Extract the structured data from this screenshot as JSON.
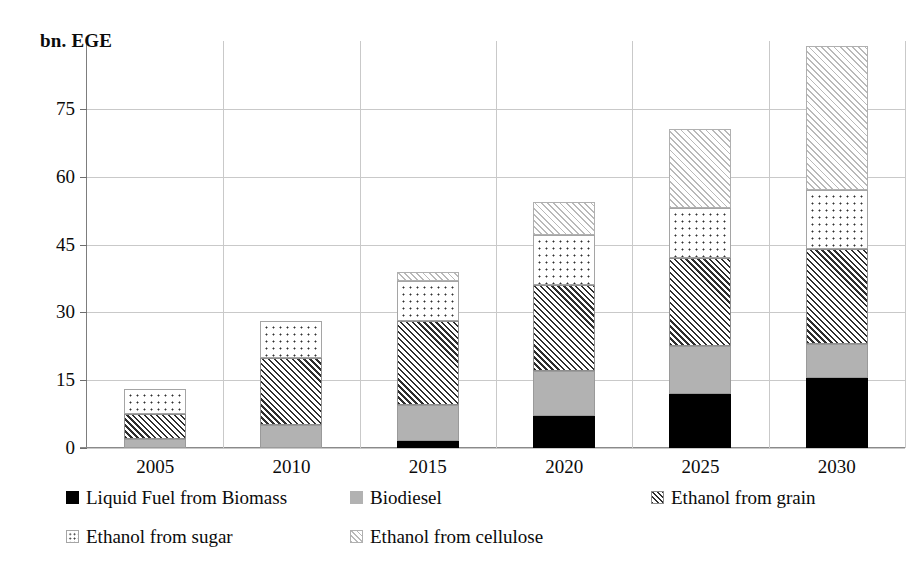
{
  "chart_data": {
    "type": "bar",
    "stacked": true,
    "title": "",
    "subtitle": "",
    "xlabel": "",
    "ylabel": "bn. EGE",
    "categories": [
      "2005",
      "2010",
      "2015",
      "2020",
      "2025",
      "2030"
    ],
    "ylim": [
      0,
      90
    ],
    "yticks": [
      0,
      15,
      30,
      45,
      60,
      75
    ],
    "ytick_labels": [
      "0",
      "15",
      "30",
      "45",
      "60",
      "75"
    ],
    "grid": "horizontal-and-vertical",
    "legend_position": "bottom",
    "series": [
      {
        "name": "Liquid Fuel from Biomass",
        "pattern": "solid-black",
        "color": "#000000",
        "values": [
          0,
          0,
          1.5,
          7,
          12,
          15.5
        ]
      },
      {
        "name": "Biodiesel",
        "pattern": "solid-gray",
        "color": "#b2b2b2",
        "values": [
          2,
          5,
          8,
          10,
          10.5,
          7.5
        ]
      },
      {
        "name": "Ethanol from grain",
        "pattern": "diagonal-hatch-dark",
        "color": "#2e2e2e",
        "values": [
          5.5,
          15,
          18.5,
          19,
          19.5,
          21
        ]
      },
      {
        "name": "Ethanol from sugar",
        "pattern": "dotted",
        "color": "#2f2f2f",
        "values": [
          5.5,
          8,
          9,
          11,
          11,
          13
        ]
      },
      {
        "name": "Ethanol from cellulose",
        "pattern": "diagonal-hatch-light",
        "color": "#b9b9b9",
        "values": [
          0,
          0,
          2,
          7.5,
          17.5,
          32
        ]
      }
    ],
    "totals": [
      13,
      28,
      39,
      54.5,
      70.5,
      89
    ]
  },
  "axis": {
    "y_title": "bn. EGE"
  },
  "legend": {
    "items": [
      {
        "label": "Liquid Fuel from Biomass",
        "pattern": "black"
      },
      {
        "label": "Biodiesel",
        "pattern": "gray"
      },
      {
        "label": "Ethanol from grain",
        "pattern": "hatch"
      },
      {
        "label": "Ethanol from sugar",
        "pattern": "dots"
      },
      {
        "label": "Ethanol from cellulose",
        "pattern": "lighthatch"
      }
    ]
  }
}
